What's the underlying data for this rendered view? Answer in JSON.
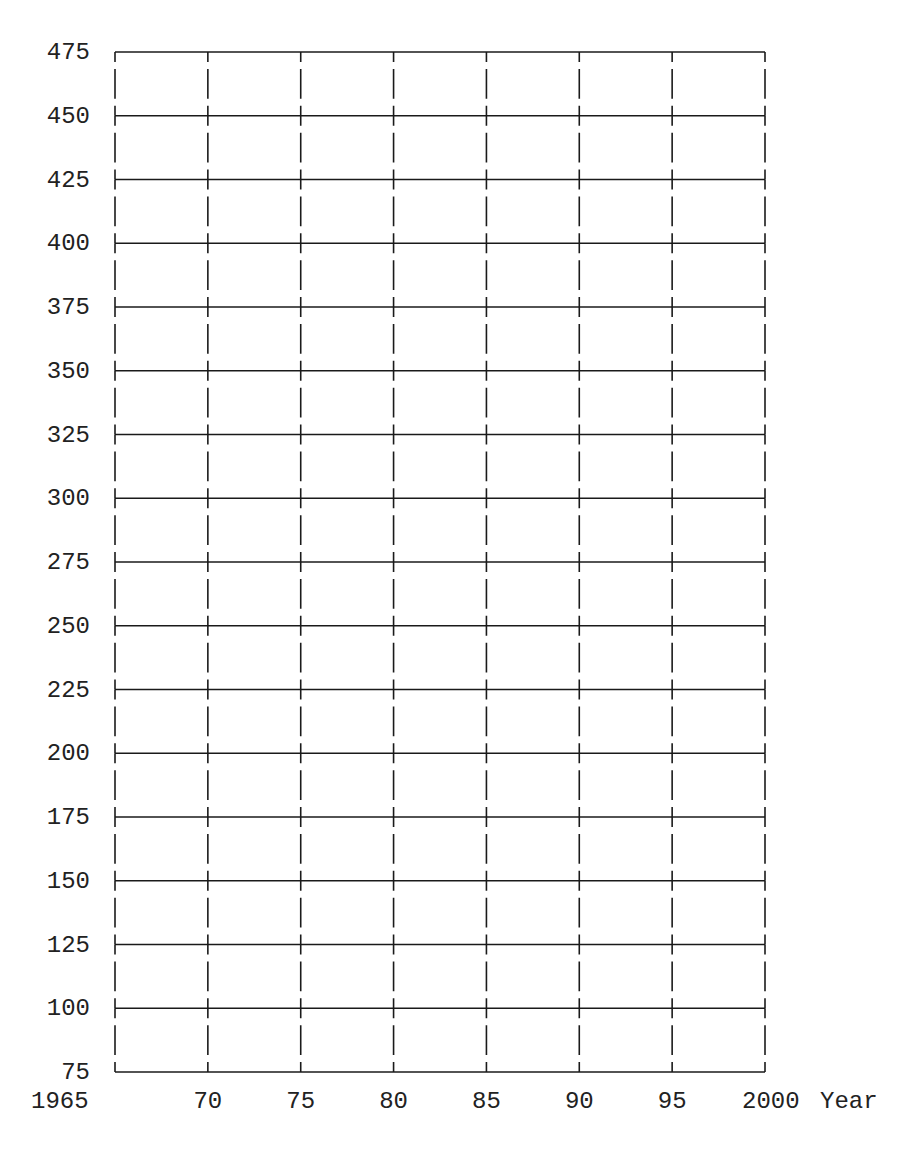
{
  "chart_data": {
    "type": "line",
    "title": "",
    "xlabel": "Year",
    "ylabel": "",
    "x_ticks": [
      1965,
      1970,
      1975,
      1980,
      1985,
      1990,
      1995,
      2000
    ],
    "x_tick_labels": [
      "1965",
      "70",
      "75",
      "80",
      "85",
      "90",
      "95",
      "2000"
    ],
    "y_ticks": [
      75,
      100,
      125,
      150,
      175,
      200,
      225,
      250,
      275,
      300,
      325,
      350,
      375,
      400,
      425,
      450,
      475
    ],
    "y_tick_labels": [
      "75",
      "100",
      "125",
      "150",
      "175",
      "200",
      "225",
      "250",
      "275",
      "300",
      "325",
      "350",
      "375",
      "400",
      "425",
      "450",
      "475"
    ],
    "xlim": [
      1965,
      2000
    ],
    "ylim": [
      75,
      475
    ],
    "grid": {
      "horizontal": "solid",
      "vertical": "dashed"
    },
    "series": [],
    "legend": null,
    "note": "Blank graph-paper grid with no plotted data"
  },
  "colors": {
    "grid": "#1a1a1a",
    "text": "#222222",
    "background": "#ffffff"
  },
  "layout": {
    "plot_left": 115,
    "plot_right": 765,
    "plot_top": 52,
    "plot_bottom": 1072
  }
}
